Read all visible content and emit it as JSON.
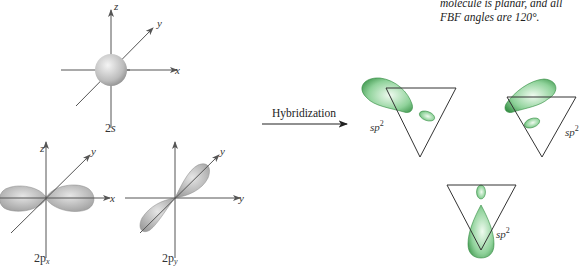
{
  "caption": {
    "line1": "molecule is planar, and all",
    "line2": "FBF angles are 120°."
  },
  "orbitals": {
    "s": {
      "label_main": "2",
      "label_sub": "s",
      "axes": [
        "z",
        "y",
        "x"
      ]
    },
    "px": {
      "label_main": "2p",
      "label_sub": "x",
      "axes": [
        "z",
        "y",
        "x"
      ]
    },
    "py": {
      "label_main": "2p",
      "label_sub": "y",
      "axes": [
        "z",
        "y",
        "x"
      ]
    }
  },
  "arrow": {
    "label": "Hybridization"
  },
  "hybrids": [
    {
      "label": "sp",
      "sup": "2"
    },
    {
      "label": "sp",
      "sup": "2"
    },
    {
      "label": "sp",
      "sup": "2"
    }
  ],
  "colors": {
    "axis": "#555555",
    "orbital_gray": "#b8b8b8",
    "hybrid_green": "#3a9a4a",
    "hybrid_light": "#d8f0d8"
  }
}
